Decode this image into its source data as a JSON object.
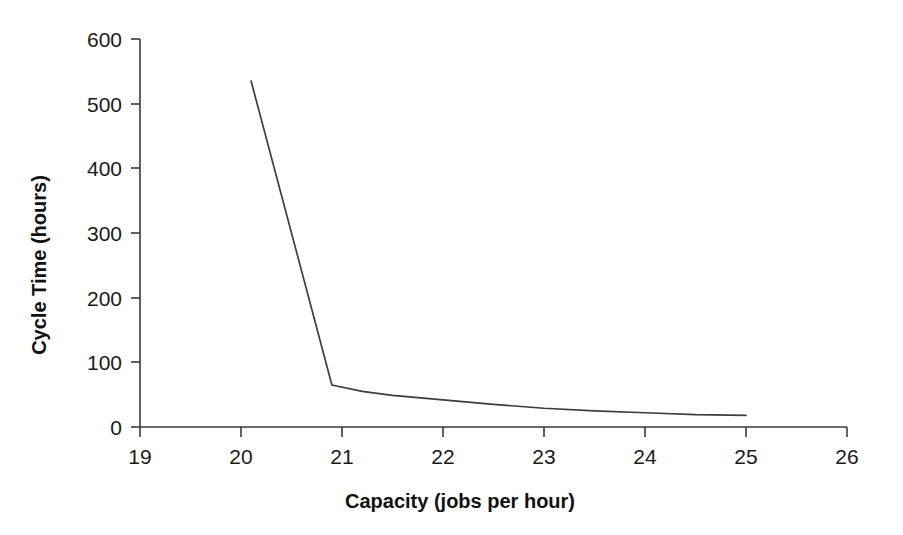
{
  "chart_data": {
    "type": "line",
    "title": "",
    "xlabel": "Capacity (jobs per hour)",
    "ylabel": "Cycle Time (hours)",
    "xlim": [
      19,
      26
    ],
    "ylim": [
      0,
      600
    ],
    "xticks": [
      19,
      20,
      21,
      22,
      23,
      24,
      25,
      26
    ],
    "xtick_labels": [
      "19",
      "20",
      "21",
      "22",
      "23",
      "24",
      "25",
      "26"
    ],
    "yticks": [
      0,
      100,
      200,
      300,
      400,
      500,
      600
    ],
    "ytick_labels": [
      "0",
      "100",
      "200",
      "300",
      "400",
      "500",
      "600"
    ],
    "grid": false,
    "legend": false,
    "legend_position": "none",
    "series": [
      {
        "name": "Cycle time vs capacity",
        "color": "#3d3d3d",
        "x": [
          20.1,
          20.9,
          21.2,
          21.5,
          22.0,
          22.5,
          23.0,
          23.5,
          24.0,
          24.5,
          25.0
        ],
        "y": [
          535,
          65,
          55,
          49,
          42,
          35,
          29,
          25,
          22,
          19,
          18
        ]
      }
    ]
  },
  "axes": {
    "x_title": "Capacity (jobs per hour)",
    "y_title": "Cycle Time (hours)"
  },
  "ticks": {
    "x": [
      "19",
      "20",
      "21",
      "22",
      "23",
      "24",
      "25",
      "26"
    ],
    "y": [
      "0",
      "100",
      "200",
      "300",
      "400",
      "500",
      "600"
    ]
  }
}
